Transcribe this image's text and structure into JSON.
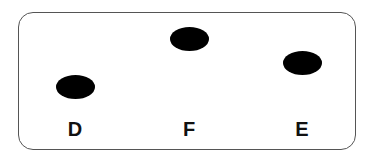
{
  "diagram": {
    "points": [
      {
        "label": "D",
        "cx": 75,
        "cy": 87
      },
      {
        "label": "F",
        "cx": 189,
        "cy": 39
      },
      {
        "label": "E",
        "cx": 302,
        "cy": 63
      }
    ],
    "label_y": 118,
    "colors": {
      "dot": "#000000",
      "border": "#555555",
      "text": "#111111"
    }
  }
}
